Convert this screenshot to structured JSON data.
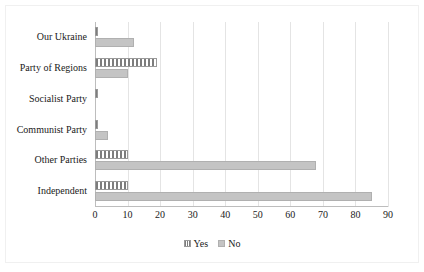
{
  "chart_data": {
    "type": "bar",
    "orientation": "horizontal",
    "title": "",
    "xlabel": "",
    "ylabel": "",
    "xlim": [
      0,
      90
    ],
    "xticks": [
      0,
      10,
      20,
      30,
      40,
      50,
      60,
      70,
      80,
      90
    ],
    "grid": true,
    "legend_position": "bottom",
    "categories": [
      "Our Ukraine",
      "Party of Regions",
      "Socialist Party",
      "Communist Party",
      "Other Parties",
      "Independent"
    ],
    "series": [
      {
        "name": "Yes",
        "pattern": "vertical-stripes",
        "color": "#7d7d7d",
        "values": [
          1,
          19,
          1,
          1,
          10,
          10
        ]
      },
      {
        "name": "No",
        "pattern": "solid",
        "color": "#c4c4c4",
        "values": [
          12,
          10,
          0,
          4,
          68,
          85
        ]
      }
    ]
  },
  "legend": {
    "items": [
      {
        "label": "Yes",
        "swatch": "yes-swatch-icon"
      },
      {
        "label": "No",
        "swatch": "no-swatch-icon"
      }
    ]
  }
}
